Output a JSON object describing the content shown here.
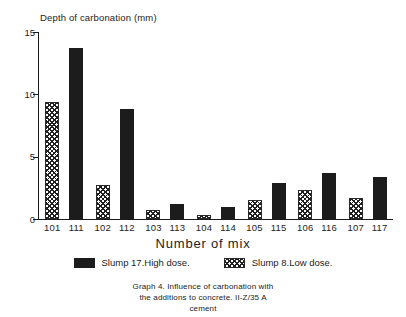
{
  "chart_data": {
    "type": "bar",
    "title": "",
    "ylabel": "Depth of carbonation (mm)",
    "xlabel": "Number of mix",
    "categories": [
      "101",
      "111",
      "102",
      "112",
      "103",
      "113",
      "104",
      "114",
      "105",
      "115",
      "106",
      "116",
      "107",
      "117"
    ],
    "series": [
      {
        "name": "Slump 8.Low dose.",
        "style": "hatch",
        "color": "#202020",
        "points": [
          {
            "category": "101",
            "value": 9.4
          },
          {
            "category": "102",
            "value": 2.7
          },
          {
            "category": "103",
            "value": 0.7
          },
          {
            "category": "104",
            "value": 0.3
          },
          {
            "category": "105",
            "value": 1.5
          },
          {
            "category": "106",
            "value": 2.3
          },
          {
            "category": "107",
            "value": 1.7
          }
        ]
      },
      {
        "name": "Slump 17.High dose.",
        "style": "solid",
        "color": "#1c1c1c",
        "points": [
          {
            "category": "111",
            "value": 13.7
          },
          {
            "category": "112",
            "value": 8.8
          },
          {
            "category": "113",
            "value": 1.2
          },
          {
            "category": "114",
            "value": 1.0
          },
          {
            "category": "115",
            "value": 2.9
          },
          {
            "category": "116",
            "value": 3.7
          },
          {
            "category": "117",
            "value": 3.4
          }
        ]
      }
    ],
    "bars": [
      {
        "category": "101",
        "value": 9.4,
        "style": "hatch"
      },
      {
        "category": "111",
        "value": 13.7,
        "style": "solid"
      },
      {
        "category": "102",
        "value": 2.7,
        "style": "hatch"
      },
      {
        "category": "112",
        "value": 8.8,
        "style": "solid"
      },
      {
        "category": "103",
        "value": 0.7,
        "style": "hatch"
      },
      {
        "category": "113",
        "value": 1.2,
        "style": "solid"
      },
      {
        "category": "104",
        "value": 0.3,
        "style": "hatch"
      },
      {
        "category": "114",
        "value": 1.0,
        "style": "solid"
      },
      {
        "category": "105",
        "value": 1.5,
        "style": "hatch"
      },
      {
        "category": "115",
        "value": 2.9,
        "style": "solid"
      },
      {
        "category": "106",
        "value": 2.3,
        "style": "hatch"
      },
      {
        "category": "116",
        "value": 3.7,
        "style": "solid"
      },
      {
        "category": "107",
        "value": 1.7,
        "style": "hatch"
      },
      {
        "category": "117",
        "value": 3.4,
        "style": "solid"
      }
    ],
    "ylim": [
      0,
      15
    ],
    "yticks": [
      0,
      5,
      10,
      15
    ],
    "ytick_labels": [
      "0",
      "5",
      "10",
      "15"
    ],
    "grid": false,
    "legend_position": "below-axis"
  },
  "legend": {
    "items": [
      {
        "label": "Slump 17.High dose.",
        "style": "solid"
      },
      {
        "label": "Slump 8.Low dose.",
        "style": "hatch"
      }
    ]
  },
  "caption": {
    "line1": "Graph 4. Influence of carbonation with",
    "line2": "the additions to concrete. II-Z/35 A",
    "line3": "cement"
  }
}
